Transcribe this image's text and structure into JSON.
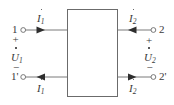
{
  "figure": {
    "stroke_color": "#5a5a5a",
    "text_color": "#3a3a3a",
    "background": "#ffffff"
  },
  "block": {
    "label": "",
    "x": 67,
    "y": 9,
    "width": 51,
    "height": 88
  },
  "ports": {
    "input": {
      "top_terminal": "1",
      "bottom_terminal": "1'",
      "plus_sign": "+",
      "minus_sign": "−",
      "voltage": "U",
      "voltage_sub": "1",
      "current_top": "I",
      "current_top_sub": "1",
      "current_bottom": "I",
      "current_bottom_sub": "1",
      "current_top_direction": "right",
      "current_bottom_direction": "left"
    },
    "output": {
      "top_terminal": "2",
      "bottom_terminal": "2'",
      "plus_sign": "+",
      "minus_sign": "−",
      "voltage": "U",
      "voltage_sub": "2",
      "current_top": "I",
      "current_top_sub": "2",
      "current_bottom": "I",
      "current_bottom_sub": "2",
      "current_top_direction": "left",
      "current_bottom_direction": "right"
    }
  }
}
